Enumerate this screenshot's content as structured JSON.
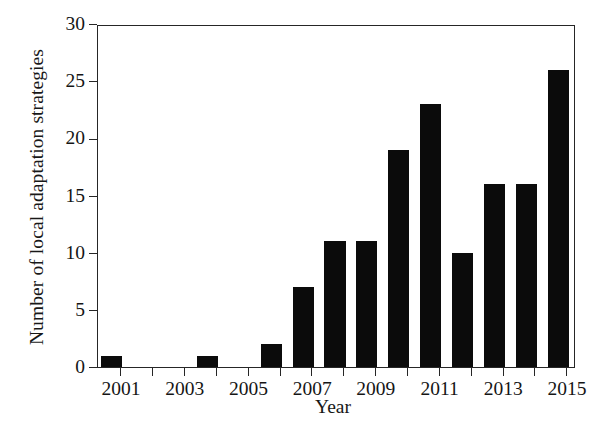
{
  "chart_data": {
    "type": "bar",
    "title": "",
    "xlabel": "Year",
    "ylabel": "Number of local adaptation strategies",
    "categories": [
      "2001",
      "2002",
      "2003",
      "2004",
      "2005",
      "2006",
      "2007",
      "2008",
      "2009",
      "2010",
      "2011",
      "2012",
      "2013",
      "2014",
      "2015"
    ],
    "values": [
      1,
      0,
      0,
      1,
      0,
      2,
      7,
      11,
      11,
      19,
      23,
      10,
      16,
      16,
      26
    ],
    "xtick_labels": [
      "2001",
      "2003",
      "2005",
      "2007",
      "2009",
      "2011",
      "2013",
      "2015"
    ],
    "ytick_labels": [
      "0",
      "5",
      "10",
      "15",
      "20",
      "25",
      "30"
    ],
    "ytick_values": [
      0,
      5,
      10,
      15,
      20,
      25,
      30
    ],
    "ylim": [
      0,
      30
    ],
    "grid": false,
    "legend": false,
    "bar_color": "#0b0b0b",
    "axis_color": "#262626",
    "background_color": "#ffffff"
  }
}
